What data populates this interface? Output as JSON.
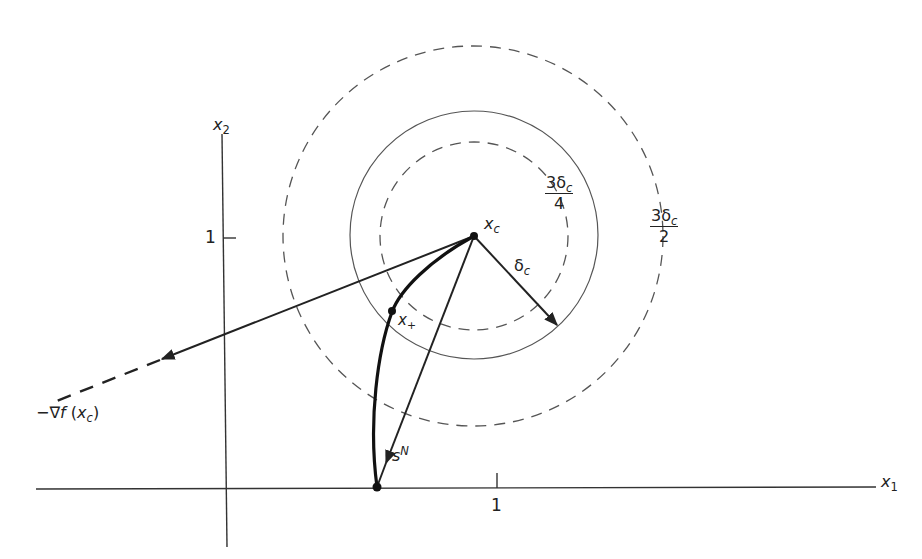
{
  "figure": {
    "axes": {
      "x_label": "x",
      "x_label_sub": "1",
      "y_label": "x",
      "y_label_sub": "2",
      "x_tick_label": "1",
      "y_tick_label": "1"
    },
    "points": {
      "xc_label": "x",
      "xc_sub": "c",
      "xplus_label": "x",
      "xplus_sub": "+"
    },
    "radii": {
      "delta_label": "δ",
      "delta_sub": "c",
      "inner_num": "3δ",
      "inner_num_sub": "c",
      "inner_den": "4",
      "outer_num": "3δ",
      "outer_num_sub": "c",
      "outer_den": "2"
    },
    "vectors": {
      "newton_label": "s",
      "newton_sup": "N",
      "gradient_prefix": "−∇",
      "gradient_f": "f",
      "gradient_open": " (",
      "gradient_x": "x",
      "gradient_sub": "c",
      "gradient_close": ")"
    },
    "colors": {
      "ink": "#222222",
      "thin_ink": "#555555",
      "background": "#ffffff"
    }
  }
}
